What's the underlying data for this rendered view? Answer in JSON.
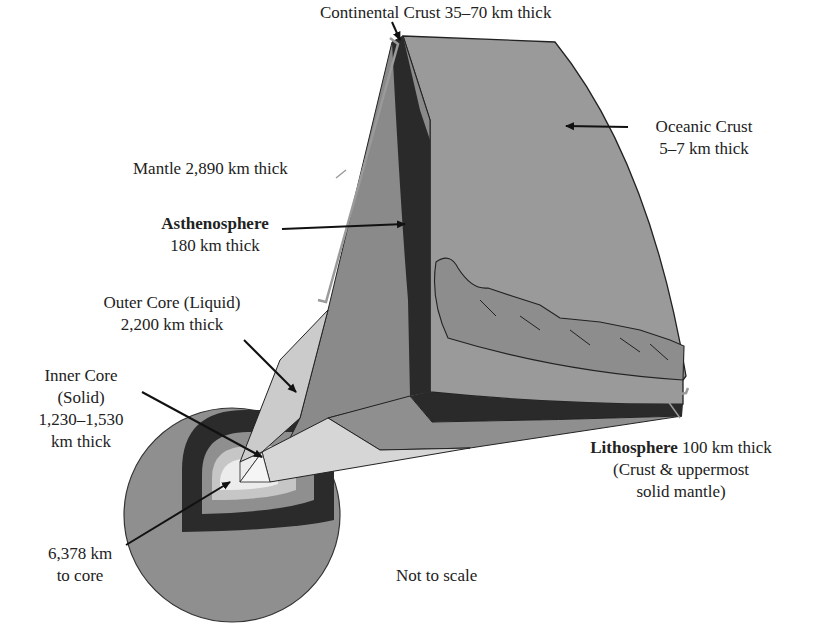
{
  "labels": {
    "continental_crust": "Continental Crust 35–70 km thick",
    "oceanic_crust_1": "Oceanic Crust",
    "oceanic_crust_2": "5–7 km thick",
    "mantle": "Mantle 2,890 km thick",
    "asthenosphere_name": "Asthenosphere",
    "asthenosphere_thickness": "180 km thick",
    "outer_core_1": "Outer Core (Liquid)",
    "outer_core_2": "2,200 km thick",
    "inner_core_1": "Inner Core",
    "inner_core_2": "(Solid)",
    "inner_core_3": "1,230–1,530",
    "inner_core_4": "km thick",
    "lithosphere_name": "Lithosphere",
    "lithosphere_thickness": "100 km thick",
    "lithosphere_desc_1": "(Crust & uppermost",
    "lithosphere_desc_2": "solid mantle)",
    "radius_1": "6,378 km",
    "radius_2": "to core",
    "note": "Not to scale"
  },
  "colors": {
    "mantle": "#8c8c8c",
    "crust_surface": "#9a9a9a",
    "asthenosphere": "#2a2a2a",
    "outer_core": "#c8c8c8",
    "inner_core": "#ececec",
    "bracket": "#9a9a9a"
  }
}
